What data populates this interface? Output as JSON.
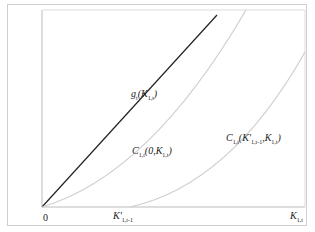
{
  "diagram": {
    "axes": {
      "origin_label": "0",
      "x_tick_label": "K'1,t-1",
      "x_axis_label": "K1,t"
    },
    "curves": [
      {
        "name": "g_t(K_1,t)",
        "label": "gt(K1,t)",
        "color": "#222222",
        "style": "straight line"
      },
      {
        "name": "C_1,t(0,K_1,t)",
        "label": "C1,t(0,K1,t)",
        "color": "#cccccc",
        "style": "convex curve"
      },
      {
        "name": "C_1,t(K'_1,t-1,K_1,t)",
        "label": "C1,t(K'1,t-1,K1,t)",
        "color": "#cccccc",
        "style": "convex curve starting at K'1,t-1"
      }
    ]
  }
}
